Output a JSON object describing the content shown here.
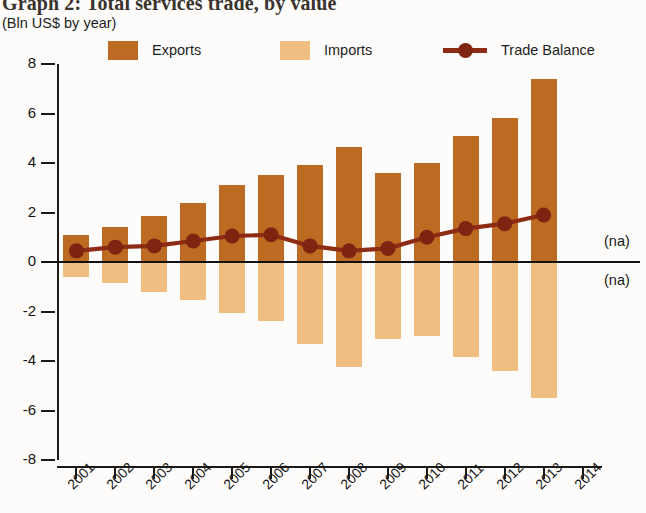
{
  "header": {
    "title": "Graph 2: Total services trade, by value",
    "subtitle": "(Bln US$ by year)"
  },
  "legend": {
    "items": [
      {
        "label": "Exports",
        "type": "swatch",
        "color": "#BD6A23"
      },
      {
        "label": "Imports",
        "type": "swatch",
        "color": "#F0BE80"
      },
      {
        "label": "Trade Balance",
        "type": "line-marker",
        "color": "#8E2B14"
      }
    ]
  },
  "annotations": {
    "na_above_zero": "(na)",
    "na_below_zero": "(na)"
  },
  "chart_data": {
    "type": "bar",
    "title": "Graph 2: Total services trade, by value",
    "subtitle": "(Bln US$ by year)",
    "xlabel": "",
    "ylabel": "",
    "ylim": [
      -8,
      8
    ],
    "yticks": [
      8,
      6,
      4,
      2,
      0,
      -2,
      -4,
      -6,
      -8
    ],
    "ytick_labels": [
      "8",
      "6",
      "4",
      "2",
      "0",
      "-2",
      "-4",
      "-6",
      "-8"
    ],
    "grid": false,
    "legend_position": "top",
    "categories": [
      "2001",
      "2002",
      "2003",
      "2004",
      "2005",
      "2006",
      "2007",
      "2008",
      "2009",
      "2010",
      "2011",
      "2012",
      "2013",
      "2014"
    ],
    "series": [
      {
        "name": "Exports",
        "type": "bar",
        "color": "#BD6A23",
        "values": [
          1.1,
          1.4,
          1.85,
          2.4,
          3.1,
          3.5,
          3.9,
          4.65,
          3.6,
          4.0,
          5.1,
          5.8,
          7.4,
          null
        ]
      },
      {
        "name": "Imports",
        "type": "bar",
        "color": "#F0BE80",
        "values": [
          -0.6,
          -0.85,
          -1.2,
          -1.55,
          -2.05,
          -2.4,
          -3.3,
          -4.25,
          -3.1,
          -3.0,
          -3.85,
          -4.4,
          -5.5,
          null
        ]
      },
      {
        "name": "Trade Balance",
        "type": "line",
        "color": "#8E2B14",
        "values": [
          0.45,
          0.6,
          0.65,
          0.85,
          1.05,
          1.1,
          0.65,
          0.45,
          0.55,
          1.0,
          1.35,
          1.55,
          1.9,
          null
        ]
      }
    ]
  }
}
